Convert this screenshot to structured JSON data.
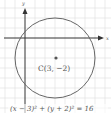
{
  "diagram": {
    "type": "circle-on-coordinate-grid",
    "axes": {
      "x_label": "x",
      "y_label": "y"
    },
    "center": {
      "label": "C(3, −2)",
      "x": 3,
      "y": -2
    },
    "radius": 4,
    "equation": "(x − 3)² + (y + 2)² = 16",
    "colors": {
      "grid": "#dddddd",
      "axis": "#333333",
      "circle": "#666666",
      "text": "#555555"
    }
  }
}
